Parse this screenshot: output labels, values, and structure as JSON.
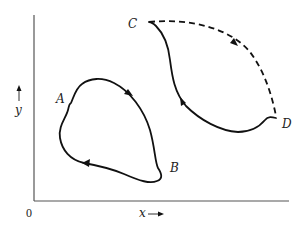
{
  "diagram": {
    "axes": {
      "origin_label": "0",
      "x_label": "x",
      "y_label": "y"
    },
    "points": [
      {
        "id": "A",
        "label": "A"
      },
      {
        "id": "B",
        "label": "B"
      },
      {
        "id": "C",
        "label": "C"
      },
      {
        "id": "D",
        "label": "D"
      }
    ],
    "paths": [
      {
        "id": "loop-AB",
        "from": "A",
        "to": "B",
        "style": "solid",
        "closed": true,
        "direction": "clockwise"
      },
      {
        "id": "C-to-D-dashed",
        "from": "C",
        "to": "D",
        "style": "dashed"
      },
      {
        "id": "D-to-C-solid",
        "from": "D",
        "to": "C",
        "style": "solid"
      }
    ],
    "colors": {
      "line": "#111111",
      "axis": "#555555",
      "background": "#ffffff"
    }
  }
}
